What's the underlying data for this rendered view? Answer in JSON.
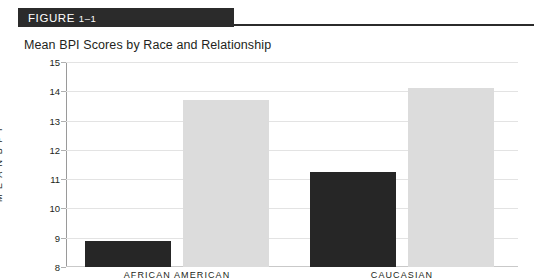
{
  "figure": {
    "banner_label": "FIGURE",
    "banner_number": "1–1",
    "title": "Mean BPI Scores by Race and Relationship"
  },
  "chart_data": {
    "type": "bar",
    "title": "Mean BPI Scores by Race and Relationship",
    "xlabel": "",
    "ylabel": "M E A N   B P I",
    "ylim": [
      8,
      15
    ],
    "yticks": [
      8,
      9,
      10,
      11,
      12,
      13,
      14,
      15
    ],
    "ytick_labels": [
      "8",
      "9",
      "10",
      "11",
      "12",
      "13",
      "14",
      "15"
    ],
    "grid": true,
    "legend": "none",
    "categories": [
      "AFRICAN AMERICAN",
      "CAUCASIAN"
    ],
    "series": [
      {
        "name": "dark-series",
        "color": "#262626",
        "values": [
          8.9,
          11.25
        ]
      },
      {
        "name": "light-series",
        "color": "#dcdcdc",
        "values": [
          13.7,
          14.1
        ]
      }
    ]
  },
  "colors": {
    "banner": "#2b2b2b",
    "rule": "#2b2b2b",
    "gridline": "#e3e3e3",
    "axis": "#9a9a9a",
    "bar_dark": "#262626",
    "bar_light": "#dcdcdc",
    "text": "#231f20"
  }
}
